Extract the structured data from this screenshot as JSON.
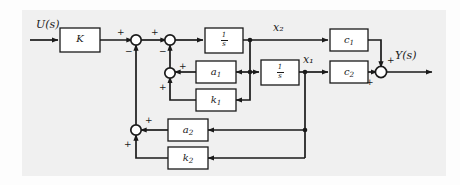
{
  "figure": {
    "type": "control-system-block-diagram",
    "background_color": "#f0f0f0",
    "line_color": "#1a1a1a"
  },
  "signals": {
    "input": "U(s)",
    "output": "Y(s)",
    "state_x2": "x₂",
    "state_x1": "x₁"
  },
  "blocks": [
    {
      "id": "K",
      "label": "K",
      "x": 60,
      "y": 25,
      "w": 40,
      "h": 22
    },
    {
      "id": "int1",
      "label": "1/s",
      "x": 205,
      "y": 28,
      "w": 38,
      "h": 24
    },
    {
      "id": "int2",
      "label": "1/s",
      "x": 261,
      "y": 60,
      "w": 38,
      "h": 24
    },
    {
      "id": "c1",
      "label": "c₁",
      "x": 330,
      "y": 28,
      "w": 38,
      "h": 22
    },
    {
      "id": "c2",
      "label": "c₂",
      "x": 330,
      "y": 61,
      "w": 38,
      "h": 22
    },
    {
      "id": "a1",
      "label": "a₁",
      "x": 196,
      "y": 61,
      "w": 38,
      "h": 22
    },
    {
      "id": "k1",
      "label": "k₁",
      "x": 196,
      "y": 89,
      "w": 38,
      "h": 22
    },
    {
      "id": "a2",
      "label": "a₂",
      "x": 168,
      "y": 122,
      "w": 38,
      "h": 22
    },
    {
      "id": "k2",
      "label": "k₂",
      "x": 168,
      "y": 150,
      "w": 38,
      "h": 22
    }
  ],
  "summing_junctions": [
    {
      "id": "sum-1",
      "cx": 136,
      "cy": 40,
      "signs": [
        "+",
        "−"
      ]
    },
    {
      "id": "sum-2",
      "cx": 170,
      "cy": 40,
      "signs": [
        "+",
        "−"
      ]
    },
    {
      "id": "sum-3",
      "cx": 170,
      "cy": 73,
      "signs": [
        "+",
        "+"
      ]
    },
    {
      "id": "sum-4",
      "cx": 136,
      "cy": 130,
      "signs": [
        "+",
        "+"
      ]
    },
    {
      "id": "sum-out",
      "cx": 381,
      "cy": 72,
      "signs": [
        "+",
        "+"
      ]
    }
  ],
  "labels": {
    "input_signal": "U(s)",
    "output_signal": "Y(s)",
    "x2": "x",
    "x2_sub": "2",
    "x1": "x",
    "x1_sub": "1",
    "gain_K": "K",
    "integrator_num": "1",
    "integrator_den": "s",
    "c1": "c",
    "c1_sub": "1",
    "c2": "c",
    "c2_sub": "2",
    "a1": "a",
    "a1_sub": "1",
    "k1": "k",
    "k1_sub": "1",
    "a2": "a",
    "a2_sub": "2",
    "k2": "k",
    "k2_sub": "2",
    "plus": "+",
    "minus": "−"
  }
}
